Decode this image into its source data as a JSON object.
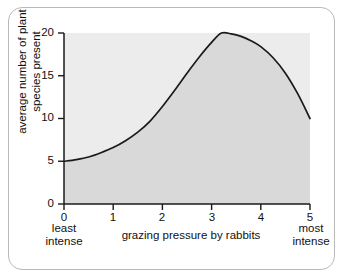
{
  "figure": {
    "frame_border_color": "#b9b9b9",
    "background_color": "#ffffff"
  },
  "chart_data": {
    "type": "line",
    "title": "",
    "subtitle": "",
    "xlabel": "grazing pressure by rabbits",
    "ylabel": "average number of plant species present",
    "ylabel_lines": [
      "average number of plant",
      "species present"
    ],
    "xlim": [
      0,
      5
    ],
    "ylim": [
      0,
      20
    ],
    "x_ticks": [
      0,
      1,
      2,
      3,
      4,
      5
    ],
    "x_tick_labels": [
      "0",
      "1",
      "2",
      "3",
      "4",
      "5"
    ],
    "y_ticks": [
      0,
      5,
      10,
      15,
      20
    ],
    "y_tick_labels": [
      "0",
      "5",
      "10",
      "15",
      "20"
    ],
    "grid": false,
    "legend": null,
    "fill_under_curve": true,
    "curve_color": "#1a1a1a",
    "fill_color": "#d9d9d9",
    "plot_background_color": "#ececec",
    "annotations": [
      {
        "name": "x-axis-left-note",
        "lines": [
          "least",
          "intense"
        ],
        "position": "below x = 0"
      },
      {
        "name": "x-axis-right-note",
        "lines": [
          "most",
          "intense"
        ],
        "position": "below x = 5"
      }
    ],
    "x": [
      0,
      0.25,
      0.5,
      0.75,
      1,
      1.25,
      1.5,
      1.75,
      2,
      2.25,
      2.5,
      2.75,
      3,
      3.2,
      3.4,
      3.6,
      3.8,
      4,
      4.25,
      4.5,
      4.75,
      5
    ],
    "values": [
      5,
      5.2,
      5.5,
      6,
      6.6,
      7.4,
      8.4,
      9.7,
      11.4,
      13.3,
      15.3,
      17.2,
      18.9,
      20,
      19.9,
      19.6,
      19.1,
      18.4,
      17.1,
      15.3,
      12.9,
      10
    ],
    "series": [
      {
        "name": "average number of plant species present",
        "x": [
          0,
          0.25,
          0.5,
          0.75,
          1,
          1.25,
          1.5,
          1.75,
          2,
          2.25,
          2.5,
          2.75,
          3,
          3.2,
          3.4,
          3.6,
          3.8,
          4,
          4.25,
          4.5,
          4.75,
          5
        ],
        "values": [
          5,
          5.2,
          5.5,
          6,
          6.6,
          7.4,
          8.4,
          9.7,
          11.4,
          13.3,
          15.3,
          17.2,
          18.9,
          20,
          19.9,
          19.6,
          19.1,
          18.4,
          17.1,
          15.3,
          12.9,
          10
        ]
      }
    ],
    "key_points": {
      "start": {
        "x": 0,
        "y": 5
      },
      "peak": {
        "x": 3.2,
        "y": 20
      },
      "end": {
        "x": 5,
        "y": 10
      }
    }
  }
}
